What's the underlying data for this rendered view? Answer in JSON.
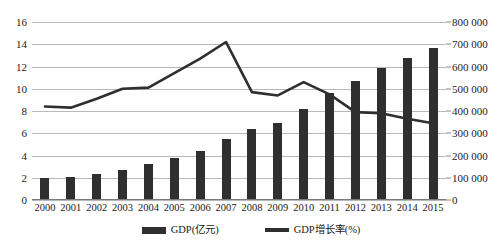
{
  "chart_data": {
    "type": "bar",
    "title": "",
    "xlabel": "",
    "ylabel": "",
    "grid": true,
    "legend_position": "bottom",
    "categories": [
      "2000",
      "2001",
      "2002",
      "2003",
      "2004",
      "2005",
      "2006",
      "2007",
      "2008",
      "2009",
      "2010",
      "2011",
      "2012",
      "2013",
      "2014",
      "2015"
    ],
    "series": [
      {
        "name": "GDP(亿元)",
        "type": "bar",
        "axis": "right",
        "values": [
          100000,
          105000,
          115000,
          135000,
          160000,
          190000,
          220000,
          275000,
          320000,
          345000,
          410000,
          480000,
          535000,
          595000,
          640000,
          685000
        ]
      },
      {
        "name": "GDP增长率(%)",
        "type": "line",
        "axis": "left",
        "values": [
          8.4,
          8.3,
          9.1,
          10.0,
          10.1,
          11.4,
          12.7,
          14.2,
          9.7,
          9.4,
          10.6,
          9.5,
          7.9,
          7.8,
          7.3,
          6.9
        ]
      }
    ],
    "left_axis": {
      "label": "",
      "min": 0,
      "max": 16,
      "step": 2,
      "ticks": [
        "0",
        "2",
        "4",
        "6",
        "8",
        "10",
        "12",
        "14",
        "16"
      ]
    },
    "right_axis": {
      "label": "",
      "min": 0,
      "max": 800000,
      "step": 100000,
      "ticks": [
        "0",
        "100 000",
        "200 000",
        "300 000",
        "400 000",
        "500 000",
        "600 000",
        "700 000",
        "800 000"
      ]
    }
  },
  "legend": {
    "items": [
      {
        "label": "GDP(亿元)",
        "marker": "bar-swatch-icon",
        "color": "#2f2f2f"
      },
      {
        "label": "GDP增长率(%)",
        "marker": "line-swatch-icon",
        "color": "#2f2f2f"
      }
    ]
  },
  "colors": {
    "bar": "#2f2f2f",
    "line": "#2f2f2f",
    "grid": "#b8b8b8",
    "text": "#1a1a1a",
    "background": "#ffffff"
  }
}
